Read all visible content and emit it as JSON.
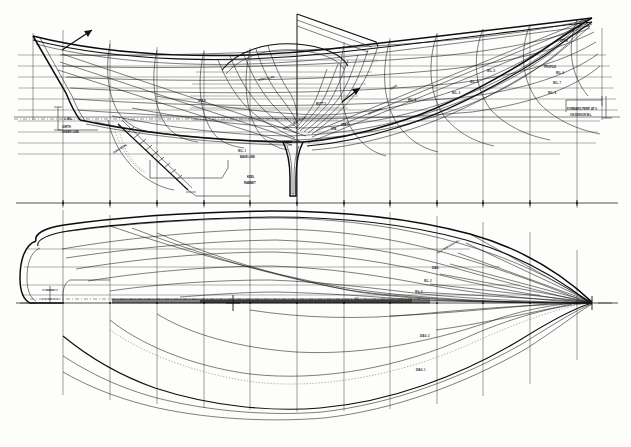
{
  "document": {
    "kind": "naval-architecture-lines-plan",
    "title": "Lines Plan",
    "media": "monochrome scanned line drawing on white paper",
    "ink_color": "#111111",
    "paper_color": "#fdfdfc",
    "width_px": 631,
    "height_px": 447
  },
  "views": [
    {
      "id": "sheer-profile",
      "name": "Sheer Plan (Profile) with Body Plan overlay",
      "bounds": {
        "x": 18,
        "y": 8,
        "width": 600,
        "height": 200
      },
      "description": "Longitudinal profile of the hull, bow at right, stern at left, with body-plan sections superimposed at midships."
    },
    {
      "id": "half-breadth",
      "name": "Half-Breadth Plan (Waterlines)",
      "bounds": {
        "x": 18,
        "y": 205,
        "width": 600,
        "height": 235
      },
      "description": "Plan view showing waterlines above the centreline and diagonals / buttocks below it. Bow at right, rounded transom at left."
    }
  ],
  "grid": {
    "station_label": "stations",
    "station_x": [
      63,
      110,
      157,
      204,
      250,
      297,
      344,
      390,
      437,
      483,
      530,
      577
    ],
    "profile_baseline_y": 203,
    "profile_waterline_y": [
      55,
      66,
      77,
      88,
      99,
      110,
      121,
      132,
      143,
      154
    ],
    "halfbreadth_centerline_y": 303,
    "halfbreadth_waterline_offsets": [
      8,
      22,
      38,
      54,
      70,
      86
    ],
    "halfbreadth_lower_offsets": [
      30,
      55,
      78,
      98
    ]
  },
  "hull": {
    "stern_x": 33,
    "bow_x": 593,
    "sheer_stern_y": 36,
    "sheer_bow_y": 22,
    "max_half_beam": 96,
    "transom_radius": 22
  },
  "annotations": [
    {
      "id": "a01",
      "text": "L.W.L.",
      "x": 64,
      "y": 118,
      "size": 3.0,
      "rot": 0,
      "weight": "700"
    },
    {
      "id": "a02",
      "text": "GIRTH",
      "x": 62,
      "y": 126,
      "size": 2.8,
      "rot": 0,
      "weight": "700"
    },
    {
      "id": "a03",
      "text": "SHEER LINE",
      "x": 62,
      "y": 131,
      "size": 2.8,
      "rot": 0,
      "weight": "700"
    },
    {
      "id": "a04",
      "text": "DIAGONAL",
      "x": 113,
      "y": 152,
      "size": 3.0,
      "rot": -33,
      "weight": "700"
    },
    {
      "id": "a05",
      "text": "W.L. 1",
      "x": 238,
      "y": 150,
      "size": 2.8,
      "rot": 0,
      "weight": "700"
    },
    {
      "id": "a06",
      "text": "BASE LINE",
      "x": 240,
      "y": 156,
      "size": 2.8,
      "rot": 0,
      "weight": "700"
    },
    {
      "id": "a07",
      "text": "KEEL",
      "x": 247,
      "y": 176,
      "size": 2.8,
      "rot": 0,
      "weight": "700"
    },
    {
      "id": "a08",
      "text": "RABBET",
      "x": 244,
      "y": 182,
      "size": 2.8,
      "rot": 0,
      "weight": "700"
    },
    {
      "id": "a09",
      "text": "STA.",
      "x": 331,
      "y": 128,
      "size": 2.8,
      "rot": 0,
      "weight": "700"
    },
    {
      "id": "a10",
      "text": "STA 5",
      "x": 341,
      "y": 124,
      "size": 2.8,
      "rot": 0,
      "weight": "700"
    },
    {
      "id": "a11",
      "text": "BUTT 2",
      "x": 316,
      "y": 103,
      "size": 2.8,
      "rot": 0,
      "weight": "700"
    },
    {
      "id": "a12",
      "text": "DIAG.",
      "x": 390,
      "y": 88,
      "size": 2.8,
      "rot": -30,
      "weight": "700"
    },
    {
      "id": "a13",
      "text": "W.L. 4",
      "x": 408,
      "y": 99,
      "size": 2.8,
      "rot": 0,
      "weight": "700"
    },
    {
      "id": "a14",
      "text": "W.L. 3",
      "x": 452,
      "y": 92,
      "size": 2.8,
      "rot": 0,
      "weight": "700"
    },
    {
      "id": "a15",
      "text": "W.L. 2",
      "x": 470,
      "y": 81,
      "size": 2.8,
      "rot": 0,
      "weight": "700"
    },
    {
      "id": "a16",
      "text": "W.L. 5",
      "x": 487,
      "y": 70,
      "size": 2.8,
      "rot": 0,
      "weight": "700"
    },
    {
      "id": "a17",
      "text": "DIAGONAL",
      "x": 368,
      "y": 113,
      "size": 2.8,
      "rot": -22,
      "weight": "700"
    },
    {
      "id": "a18",
      "text": "BUTTOCK",
      "x": 293,
      "y": 122,
      "size": 2.8,
      "rot": -24,
      "weight": "700"
    },
    {
      "id": "a19",
      "text": "BUTTOCK 1",
      "x": 283,
      "y": 128,
      "size": 2.8,
      "rot": -24,
      "weight": "700"
    },
    {
      "id": "a20",
      "text": "STEM",
      "x": 560,
      "y": 40,
      "size": 2.8,
      "rot": 0,
      "weight": "700"
    },
    {
      "id": "a21",
      "text": "PROFILE",
      "x": 544,
      "y": 66,
      "size": 2.8,
      "rot": 0,
      "weight": "700"
    },
    {
      "id": "a22",
      "text": "W.L. 6",
      "x": 556,
      "y": 72,
      "size": 2.8,
      "rot": 0,
      "weight": "700"
    },
    {
      "id": "a23",
      "text": "W.L. 7",
      "x": 553,
      "y": 82,
      "size": 2.8,
      "rot": 0,
      "weight": "700"
    },
    {
      "id": "a24",
      "text": "W.L. 8",
      "x": 548,
      "y": 92,
      "size": 2.8,
      "rot": 0,
      "weight": "700"
    },
    {
      "id": "a25",
      "text": "FORWARD PERP. AT 0",
      "x": 567,
      "y": 108,
      "size": 2.8,
      "rot": 0,
      "weight": "700"
    },
    {
      "id": "a26",
      "text": "ON DESIGN W.L.",
      "x": 570,
      "y": 114,
      "size": 2.8,
      "rot": 0,
      "weight": "700"
    },
    {
      "id": "a27",
      "text": "HALF BREADTH W.L.",
      "x": 437,
      "y": 253,
      "size": 2.6,
      "rot": -30,
      "weight": "700"
    },
    {
      "id": "a28",
      "text": "DIAG.",
      "x": 432,
      "y": 268,
      "size": 2.6,
      "rot": 0,
      "weight": "700"
    },
    {
      "id": "a29",
      "text": "W.L. 3",
      "x": 424,
      "y": 281,
      "size": 2.6,
      "rot": 0,
      "weight": "700"
    },
    {
      "id": "a30",
      "text": "W.L. 2",
      "x": 415,
      "y": 292,
      "size": 2.6,
      "rot": 0,
      "weight": "700"
    },
    {
      "id": "a31",
      "text": "C.L.",
      "x": 355,
      "y": 299,
      "size": 2.6,
      "rot": 0,
      "weight": "700"
    },
    {
      "id": "a32",
      "text": "DIAG. 2",
      "x": 420,
      "y": 336,
      "size": 2.6,
      "rot": 0,
      "weight": "700"
    },
    {
      "id": "a33",
      "text": "DIAG. 1",
      "x": 416,
      "y": 370,
      "size": 2.6,
      "rot": 0,
      "weight": "700"
    },
    {
      "id": "a34",
      "text": "STA 9",
      "x": 198,
      "y": 100,
      "size": 2.8,
      "rot": 0,
      "weight": "700"
    },
    {
      "id": "a35",
      "text": "BODY PLAN",
      "x": 258,
      "y": 79,
      "size": 2.8,
      "rot": -12,
      "weight": "700"
    }
  ]
}
